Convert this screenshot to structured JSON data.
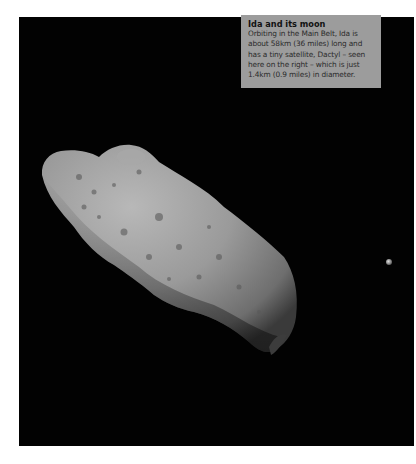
{
  "caption": {
    "title": "Ida and its moon",
    "body": "Orbiting in the Main Belt, Ida is about 58km (36 miles) long and has a tiny satellite, Dactyl – seen here on the right – which is just 1.4km (0.9 miles) in diameter."
  },
  "image": {
    "subject": "asteroid-ida",
    "moon": "dactyl",
    "background_color": "#020202",
    "caption_bg": "#9c9c9c"
  }
}
